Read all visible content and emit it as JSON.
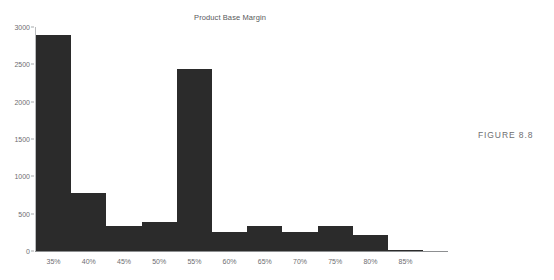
{
  "figure": {
    "caption": "FIGURE 8.8"
  },
  "chart_data": {
    "type": "bar",
    "title": "Product Base Margin",
    "xlabel": "",
    "ylabel": "",
    "categories": [
      "35%",
      "40%",
      "45%",
      "50%",
      "55%",
      "60%",
      "65%",
      "70%",
      "75%",
      "80%",
      "85%"
    ],
    "values": [
      2890,
      780,
      340,
      390,
      2440,
      250,
      340,
      250,
      340,
      220,
      20
    ],
    "ylim": [
      0,
      3000
    ],
    "yticks": [
      0,
      500,
      1000,
      1500,
      2000,
      2500,
      3000
    ],
    "ytick_labels": [
      "0",
      "500",
      "1000",
      "1500",
      "2000",
      "2500",
      "3000"
    ],
    "grid": false,
    "legend": "none",
    "bar_color": "#2b2b2b",
    "axis_color": "#6d6e71"
  }
}
